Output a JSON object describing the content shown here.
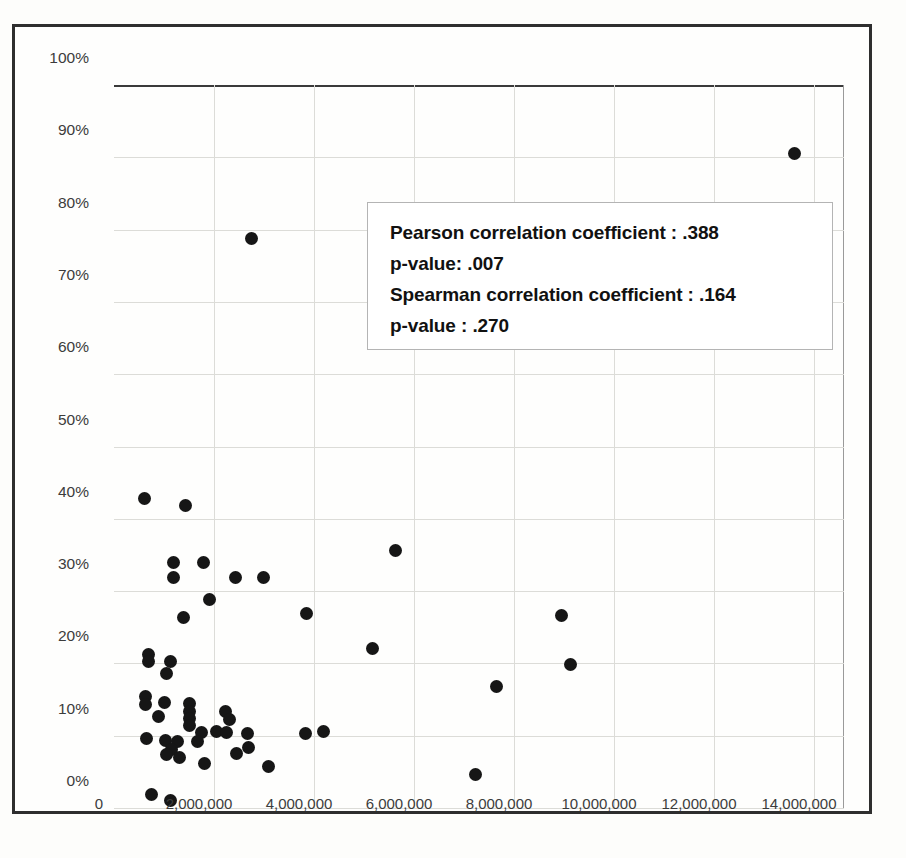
{
  "chart_data": {
    "type": "scatter",
    "title": "",
    "xlabel": "",
    "ylabel": "",
    "xlim": [
      0,
      14600000
    ],
    "ylim": [
      0,
      1.0
    ],
    "grid": true,
    "legend": null,
    "x_ticks": [
      "0",
      "2,000,000",
      "4,000,000",
      "6,000,000",
      "8,000,000",
      "10,000,000",
      "12,000,000",
      "14,000,000"
    ],
    "x_tick_values": [
      0,
      2000000,
      4000000,
      6000000,
      8000000,
      10000000,
      12000000,
      14000000
    ],
    "y_ticks": [
      "0%",
      "10%",
      "20%",
      "30%",
      "40%",
      "50%",
      "60%",
      "70%",
      "80%",
      "90%",
      "100%"
    ],
    "y_tick_values": [
      0,
      10,
      20,
      30,
      40,
      50,
      60,
      70,
      80,
      90,
      100
    ],
    "marker": "filled-circle",
    "marker_color": "#161616",
    "points": [
      {
        "x": 13600000,
        "y": 90.5
      },
      {
        "x": 2740000,
        "y": 78.7
      },
      {
        "x": 600000,
        "y": 42.8
      },
      {
        "x": 1420000,
        "y": 41.8
      },
      {
        "x": 5620000,
        "y": 35.6
      },
      {
        "x": 1180000,
        "y": 34.0
      },
      {
        "x": 1780000,
        "y": 34.0
      },
      {
        "x": 1180000,
        "y": 31.9
      },
      {
        "x": 2420000,
        "y": 31.9
      },
      {
        "x": 2980000,
        "y": 31.9
      },
      {
        "x": 1900000,
        "y": 28.9
      },
      {
        "x": 3840000,
        "y": 26.9
      },
      {
        "x": 8940000,
        "y": 26.6
      },
      {
        "x": 1380000,
        "y": 26.3
      },
      {
        "x": 5160000,
        "y": 22.0
      },
      {
        "x": 9120000,
        "y": 19.8
      },
      {
        "x": 680000,
        "y": 21.2
      },
      {
        "x": 680000,
        "y": 20.2
      },
      {
        "x": 1120000,
        "y": 20.3
      },
      {
        "x": 1040000,
        "y": 18.6
      },
      {
        "x": 7640000,
        "y": 16.8
      },
      {
        "x": 620000,
        "y": 15.4
      },
      {
        "x": 620000,
        "y": 14.3
      },
      {
        "x": 1000000,
        "y": 14.6
      },
      {
        "x": 1500000,
        "y": 14.4
      },
      {
        "x": 1500000,
        "y": 13.3
      },
      {
        "x": 2220000,
        "y": 13.4
      },
      {
        "x": 1500000,
        "y": 12.4
      },
      {
        "x": 2300000,
        "y": 12.2
      },
      {
        "x": 880000,
        "y": 12.7
      },
      {
        "x": 1500000,
        "y": 11.4
      },
      {
        "x": 2040000,
        "y": 10.6
      },
      {
        "x": 1740000,
        "y": 10.4
      },
      {
        "x": 2240000,
        "y": 10.4
      },
      {
        "x": 2660000,
        "y": 10.3
      },
      {
        "x": 3820000,
        "y": 10.3
      },
      {
        "x": 4180000,
        "y": 10.6
      },
      {
        "x": 640000,
        "y": 9.6
      },
      {
        "x": 1020000,
        "y": 9.4
      },
      {
        "x": 1260000,
        "y": 9.2
      },
      {
        "x": 1660000,
        "y": 9.2
      },
      {
        "x": 2680000,
        "y": 8.4
      },
      {
        "x": 1140000,
        "y": 8.1
      },
      {
        "x": 1040000,
        "y": 7.4
      },
      {
        "x": 2440000,
        "y": 7.6
      },
      {
        "x": 1300000,
        "y": 7.0
      },
      {
        "x": 1800000,
        "y": 6.1
      },
      {
        "x": 3080000,
        "y": 5.7
      },
      {
        "x": 7220000,
        "y": 4.7
      },
      {
        "x": 740000,
        "y": 1.8
      },
      {
        "x": 1120000,
        "y": 1.1
      }
    ],
    "annotation": {
      "lines": [
        "Pearson correlation coefficient :  .388",
        "p-value: .007",
        "Spearman correlation coefficient :  .164",
        "p-value :  .270"
      ],
      "pearson_r": ".388",
      "pearson_p": ".007",
      "spearman_r": ".164",
      "spearman_p": ".270"
    }
  }
}
